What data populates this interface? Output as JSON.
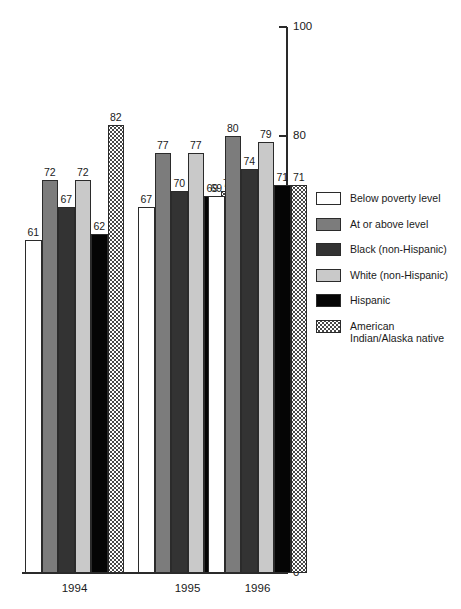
{
  "artifact": {
    "top_left_text": " "
  },
  "axis": {
    "y_ticks": [
      "0",
      "20",
      "40",
      "60",
      "80",
      "100"
    ],
    "x_labels": [
      "1994",
      "1995",
      "1996"
    ]
  },
  "legend": {
    "items": [
      {
        "label": "Below poverty level",
        "swatch": "white-swatch",
        "fill": "#ffffff"
      },
      {
        "label": "At or above level",
        "swatch": "gray-swatch",
        "fill": "#7c7c7c"
      },
      {
        "label": "Black (non-Hispanic)",
        "swatch": "dark-gray-swatch",
        "fill": "#333333"
      },
      {
        "label": "White (non-Hispanic)",
        "swatch": "light-gray-swatch",
        "fill": "#c9c9c9"
      },
      {
        "label": "Hispanic",
        "swatch": "black-swatch",
        "fill": "#050505"
      },
      {
        "label": "American Indian/Alaska native",
        "swatch": "stippled-swatch",
        "fill": "#ffffff"
      }
    ]
  },
  "chart_data": {
    "type": "bar",
    "title": "",
    "subtitle": "",
    "xlabel": "",
    "ylabel": "",
    "ylim": [
      0,
      100
    ],
    "yticks": [
      0,
      20,
      40,
      60,
      80,
      100
    ],
    "grid": false,
    "legend_position": "right",
    "categories": [
      "1994",
      "1995",
      "1996"
    ],
    "series": [
      {
        "name": "Below poverty level",
        "values": [
          61,
          67,
          69
        ]
      },
      {
        "name": "At or above level",
        "values": [
          72,
          77,
          80
        ]
      },
      {
        "name": "Black (non-Hispanic)",
        "values": [
          67,
          70,
          74
        ]
      },
      {
        "name": "White (non-Hispanic)",
        "values": [
          72,
          77,
          79
        ]
      },
      {
        "name": "Hispanic",
        "values": [
          62,
          69,
          71
        ]
      },
      {
        "name": "American Indian/Alaska native",
        "values": [
          82,
          70,
          71
        ]
      }
    ],
    "bar_labels": {
      "1994": [
        "61",
        "72",
        "67",
        "72",
        "62",
        "82"
      ],
      "1995": [
        "67",
        "77",
        "70",
        "77",
        "69",
        "70"
      ],
      "1996": [
        "69",
        "80",
        "74",
        "79",
        "71",
        "71"
      ]
    }
  }
}
